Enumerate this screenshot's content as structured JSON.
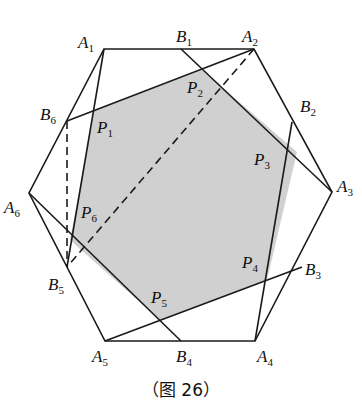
{
  "figure": {
    "caption": "（图 26）",
    "colors": {
      "line": "#1a1a1a",
      "fill": "#d0d0d0"
    },
    "points": {
      "A1": [
        104,
        49
      ],
      "A2": [
        254,
        49
      ],
      "A3": [
        332,
        192
      ],
      "A4": [
        255,
        341
      ],
      "A5": [
        105,
        341
      ],
      "A6": [
        29,
        193
      ],
      "B1": [
        181,
        49
      ],
      "B2": [
        292,
        122
      ],
      "B3": [
        302,
        267
      ],
      "B4": [
        181,
        341
      ],
      "B5": [
        67,
        267
      ],
      "B6": [
        67,
        121
      ]
    },
    "labels": [
      {
        "id": "A1",
        "main": "A",
        "sub": "1",
        "x": 78,
        "y": 48
      },
      {
        "id": "B1",
        "main": "B",
        "sub": "1",
        "x": 176,
        "y": 42
      },
      {
        "id": "A2",
        "main": "A",
        "sub": "2",
        "x": 242,
        "y": 42
      },
      {
        "id": "B2",
        "main": "B",
        "sub": "2",
        "x": 300,
        "y": 112
      },
      {
        "id": "A3",
        "main": "A",
        "sub": "3",
        "x": 337,
        "y": 192
      },
      {
        "id": "B3",
        "main": "B",
        "sub": "3",
        "x": 305,
        "y": 275
      },
      {
        "id": "A4",
        "main": "A",
        "sub": "4",
        "x": 257,
        "y": 362
      },
      {
        "id": "B4",
        "main": "B",
        "sub": "4",
        "x": 176,
        "y": 362
      },
      {
        "id": "A5",
        "main": "A",
        "sub": "5",
        "x": 92,
        "y": 362
      },
      {
        "id": "B5",
        "main": "B",
        "sub": "5",
        "x": 48,
        "y": 290
      },
      {
        "id": "A6",
        "main": "A",
        "sub": "6",
        "x": 4,
        "y": 213
      },
      {
        "id": "B6",
        "main": "B",
        "sub": "6",
        "x": 40,
        "y": 120
      },
      {
        "id": "P1",
        "main": "P",
        "sub": "1",
        "x": 97,
        "y": 133
      },
      {
        "id": "P2",
        "main": "P",
        "sub": "2",
        "x": 187,
        "y": 93
      },
      {
        "id": "P3",
        "main": "P",
        "sub": "3",
        "x": 254,
        "y": 165
      },
      {
        "id": "P4",
        "main": "P",
        "sub": "4",
        "x": 242,
        "y": 268
      },
      {
        "id": "P5",
        "main": "P",
        "sub": "5",
        "x": 151,
        "y": 303
      },
      {
        "id": "P6",
        "main": "P",
        "sub": "6",
        "x": 81,
        "y": 218
      }
    ]
  }
}
